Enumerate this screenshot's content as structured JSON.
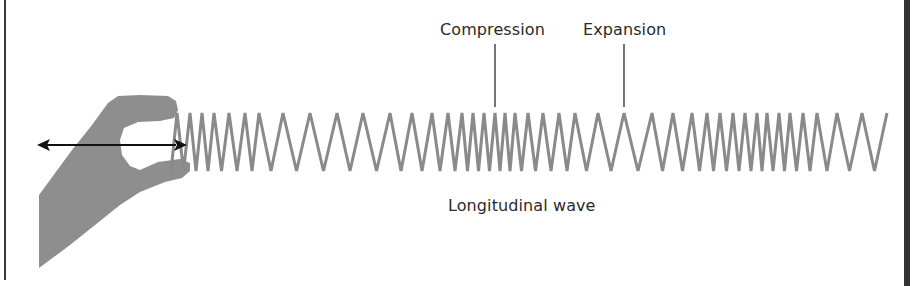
{
  "diagram": {
    "title": "Longitudinal wave",
    "labels": {
      "compression": "Compression",
      "expansion": "Expansion",
      "wave": "Longitudinal wave"
    },
    "elements": {
      "hand": "hand-pinching-spring-icon",
      "arrow": "double-headed-horizontal-arrow",
      "spring": "slinky-spring-zigzag"
    },
    "colors": {
      "spring": "#8a8a8a",
      "hand": "#8c8c8c",
      "arrow": "#111111",
      "text": "#2a2a2a",
      "frame": "#333333"
    },
    "spring_peaks_x": [
      177,
      190,
      202,
      214,
      229,
      245,
      259,
      283,
      310,
      337,
      363,
      390,
      412,
      432,
      448,
      462,
      473,
      484,
      495,
      505,
      515,
      528,
      543,
      559,
      575,
      598,
      624,
      652,
      673,
      692,
      707,
      720,
      733,
      745,
      757,
      767,
      779,
      790,
      803,
      817,
      837,
      862,
      887
    ],
    "spring_top_y": 113,
    "spring_bottom_y": 171
  }
}
